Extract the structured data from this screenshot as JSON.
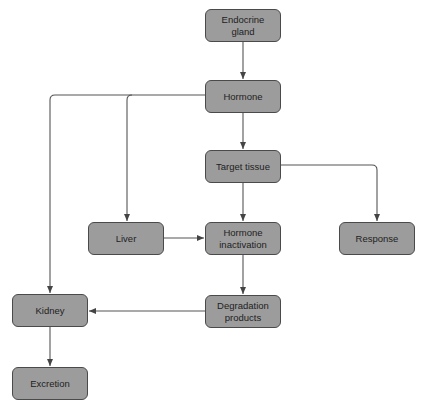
{
  "diagram": {
    "nodes": [
      {
        "id": "endocrine_gland",
        "label": "Endocrine gland"
      },
      {
        "id": "hormone",
        "label": "Hormone"
      },
      {
        "id": "target_tissue",
        "label": "Target tissue"
      },
      {
        "id": "liver",
        "label": "Liver"
      },
      {
        "id": "hormone_inactivation",
        "label": "Hormone inactivation"
      },
      {
        "id": "response",
        "label": "Response"
      },
      {
        "id": "kidney",
        "label": "Kidney"
      },
      {
        "id": "degradation_products",
        "label": "Degradation products"
      },
      {
        "id": "excretion",
        "label": "Excretion"
      }
    ],
    "edges": [
      {
        "from": "endocrine_gland",
        "to": "hormone"
      },
      {
        "from": "hormone",
        "to": "target_tissue"
      },
      {
        "from": "hormone",
        "to": "liver"
      },
      {
        "from": "hormone",
        "to": "kidney"
      },
      {
        "from": "target_tissue",
        "to": "hormone_inactivation"
      },
      {
        "from": "target_tissue",
        "to": "response"
      },
      {
        "from": "liver",
        "to": "hormone_inactivation"
      },
      {
        "from": "hormone_inactivation",
        "to": "degradation_products"
      },
      {
        "from": "degradation_products",
        "to": "kidney"
      },
      {
        "from": "kidney",
        "to": "excretion"
      }
    ],
    "colors": {
      "node_fill": "#9c9c9c",
      "node_border": "#4a4a4a",
      "line": "#555555"
    }
  }
}
